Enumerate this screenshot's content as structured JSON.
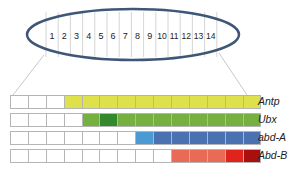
{
  "ellipse": {
    "segments": [
      "1",
      "2",
      "3",
      "4",
      "5",
      "6",
      "7",
      "8",
      "9",
      "10",
      "11",
      "12",
      "13",
      "14"
    ],
    "stroke_color": "#3e5777"
  },
  "genes": [
    {
      "name": "Antp",
      "cells": [
        "#ffffff",
        "#ffffff",
        "#ffffff",
        "#dfe14a",
        "#dfe14a",
        "#dfe14a",
        "#dfe14a",
        "#dfe14a",
        "#dfe14a",
        "#dfe14a",
        "#dfe14a",
        "#dfe14a",
        "#dfe14a",
        "#dfe14a"
      ]
    },
    {
      "name": "Ubx",
      "cells": [
        "#ffffff",
        "#ffffff",
        "#ffffff",
        "#ffffff",
        "#76b041",
        "#338a2e",
        "#76b041",
        "#76b041",
        "#76b041",
        "#76b041",
        "#76b041",
        "#76b041",
        "#76b041",
        "#76b041"
      ]
    },
    {
      "name": "abd-A",
      "cells": [
        "#ffffff",
        "#ffffff",
        "#ffffff",
        "#ffffff",
        "#ffffff",
        "#ffffff",
        "#ffffff",
        "#4b9ad3",
        "#4a72b0",
        "#4a72b0",
        "#4a72b0",
        "#4a72b0",
        "#4a72b0",
        "#4a72b0"
      ]
    },
    {
      "name": "Abd-B",
      "cells": [
        "#ffffff",
        "#ffffff",
        "#ffffff",
        "#ffffff",
        "#ffffff",
        "#ffffff",
        "#ffffff",
        "#ffffff",
        "#ffffff",
        "#ea6b55",
        "#ea6b55",
        "#ea6b55",
        "#e0231b",
        "#a8100f"
      ]
    }
  ]
}
